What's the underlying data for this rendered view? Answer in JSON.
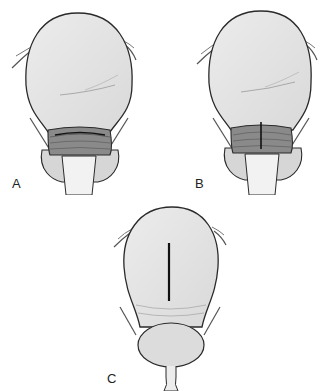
{
  "figures": [
    {
      "id": "A",
      "label": "A",
      "description": "Uterus with transverse lower-segment incision"
    },
    {
      "id": "B",
      "label": "B",
      "description": "Uterus with low vertical lower-segment incision"
    },
    {
      "id": "C",
      "label": "C",
      "description": "Uterus with classical vertical fundal incision"
    }
  ],
  "colors": {
    "outline": "#2a2a2a",
    "fill": "#e6e6e6",
    "shade": "#9a9a9a",
    "incision": "#1a1a1a"
  }
}
